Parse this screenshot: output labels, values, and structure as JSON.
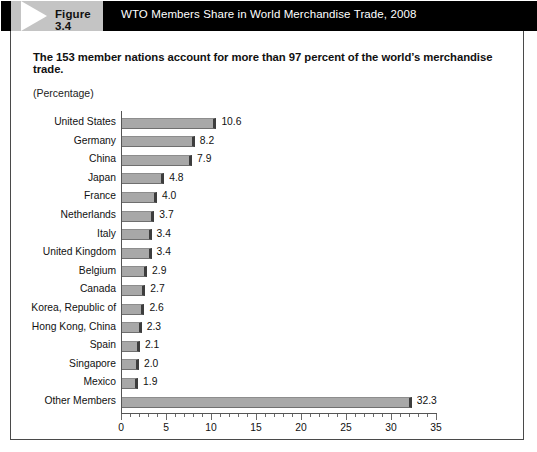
{
  "figure": {
    "tag": "Figure 3.4",
    "header_title": "WTO Members Share in World Merchandise Trade, 2008",
    "subtitle": "The 153 member nations account for more than 97 percent of the world’s merchandise trade.",
    "unit_label": "(Percentage)"
  },
  "colors": {
    "header_background": "#000000",
    "tag_background": "#c4c4c4",
    "bar_fill": "#a8a8a8",
    "bar_edge": "#3d3d3d",
    "axis": "#555555",
    "text": "#111111"
  },
  "chart_data": {
    "type": "bar",
    "orientation": "horizontal",
    "title": "WTO Members Share in World Merchandise Trade, 2008",
    "subtitle": "The 153 member nations account for more than 97 percent of the world’s merchandise trade.",
    "xlabel": "",
    "ylabel": "",
    "unit": "Percentage",
    "xlim": [
      0,
      35
    ],
    "xticks": [
      0,
      5,
      10,
      15,
      20,
      25,
      30,
      35
    ],
    "xtick_labels": [
      "0",
      "5",
      "10",
      "15",
      "20",
      "25",
      "30",
      "35"
    ],
    "minor_tick_interval": 1,
    "grid": false,
    "legend": false,
    "categories": [
      "United States",
      "Germany",
      "China",
      "Japan",
      "France",
      "Netherlands",
      "Italy",
      "United Kingdom",
      "Belgium",
      "Canada",
      "Korea, Republic of",
      "Hong Kong, China",
      "Spain",
      "Singapore",
      "Mexico",
      "Other Members"
    ],
    "values": [
      10.6,
      8.2,
      7.9,
      4.8,
      4.0,
      3.7,
      3.4,
      3.4,
      2.9,
      2.7,
      2.6,
      2.3,
      2.1,
      2.0,
      1.9,
      32.3
    ],
    "value_labels": [
      "10.6",
      "8.2",
      "7.9",
      "4.8",
      "4.0",
      "3.7",
      "3.4",
      "3.4",
      "2.9",
      "2.7",
      "2.6",
      "2.3",
      "2.1",
      "2.0",
      "1.9",
      "32.3"
    ]
  }
}
